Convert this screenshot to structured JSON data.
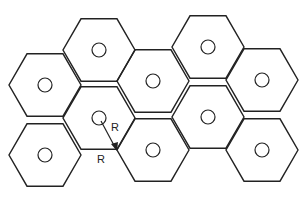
{
  "diagram": {
    "type": "hexagonal-cell-layout",
    "cell_radius_px": 36,
    "cells": [
      {
        "id": "c1",
        "cx": 45,
        "cy": 85
      },
      {
        "id": "c2",
        "cx": 99,
        "cy": 50
      },
      {
        "id": "c3",
        "cx": 153,
        "cy": 81
      },
      {
        "id": "c4",
        "cx": 208,
        "cy": 47
      },
      {
        "id": "c5",
        "cx": 262,
        "cy": 80
      },
      {
        "id": "c6",
        "cx": 45,
        "cy": 155
      },
      {
        "id": "c7",
        "cx": 99,
        "cy": 118
      },
      {
        "id": "c8",
        "cx": 153,
        "cy": 150
      },
      {
        "id": "c9",
        "cx": 208,
        "cy": 117
      },
      {
        "id": "c10",
        "cx": 262,
        "cy": 150
      }
    ],
    "labels": {
      "radius_arrow": "R",
      "radius_edge": "R"
    }
  }
}
